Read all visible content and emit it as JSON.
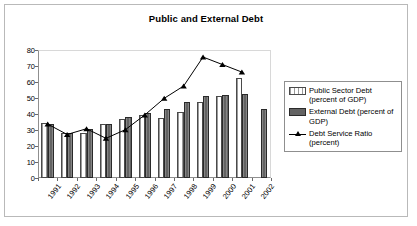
{
  "chart_data": {
    "type": "bar",
    "title": "Public and External Debt",
    "xlabel": "",
    "ylabel": "",
    "ylim": [
      0,
      80
    ],
    "yticks": [
      0,
      10,
      20,
      30,
      40,
      50,
      60,
      70,
      80
    ],
    "grid": false,
    "legend_position": "right",
    "categories": [
      "1991",
      "1992",
      "1993",
      "1994",
      "1995",
      "1996",
      "1997",
      "1998",
      "1999",
      "2000",
      "2001",
      "2002"
    ],
    "series": [
      {
        "name": "Public Sector Debt (percent of GDP)",
        "type": "bar",
        "values": [
          34.6,
          28.0,
          28.4,
          33.9,
          36.8,
          39.4,
          37.6,
          41.3,
          47.8,
          51.0,
          62.4,
          null
        ]
      },
      {
        "name": "External Debt (percent of GDP)",
        "type": "bar",
        "values": [
          33.6,
          28.4,
          30.4,
          33.5,
          38.4,
          40.9,
          43.0,
          47.6,
          51.4,
          51.9,
          52.8,
          43.1
        ]
      },
      {
        "name": "Debt Service Ratio (percent)",
        "type": "line",
        "marker": "triangle",
        "values": [
          33.7,
          27.2,
          30.8,
          24.8,
          30.2,
          39.4,
          49.8,
          57.5,
          75.6,
          70.9,
          66.2,
          null
        ]
      }
    ]
  },
  "legend": {
    "entries": [
      {
        "label": "Public Sector Debt (percent of GDP)",
        "key": "public"
      },
      {
        "label": "External Debt (percent of GDP)",
        "key": "external"
      },
      {
        "label": "Debt Service Ratio (percent)",
        "key": "line"
      }
    ]
  },
  "colors": {
    "public_bar_fill": "#ffffff",
    "public_bar_border": "#4a4a4a",
    "external_bar_fill": "#636363",
    "external_bar_border": "#2a2a2a",
    "line_series": "#000000",
    "axis": "#6a6a6a",
    "frame": "#b9b9b9"
  }
}
